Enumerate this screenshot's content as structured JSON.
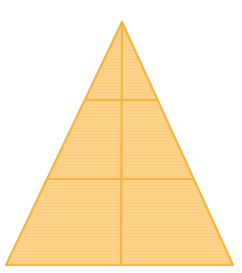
{
  "diagram": {
    "shape": "triangle-divided",
    "apex": [
      122,
      22
    ],
    "base_left": [
      6,
      265
    ],
    "base_right": [
      233,
      265
    ],
    "horizontal_lines_y": [
      100,
      179
    ],
    "vertical_line_x": 121,
    "colors": {
      "fill": "#FDD28A",
      "stripe": "#F8C878",
      "stroke": "#F6B440"
    },
    "stroke_width": 2.2,
    "regions": 6
  }
}
